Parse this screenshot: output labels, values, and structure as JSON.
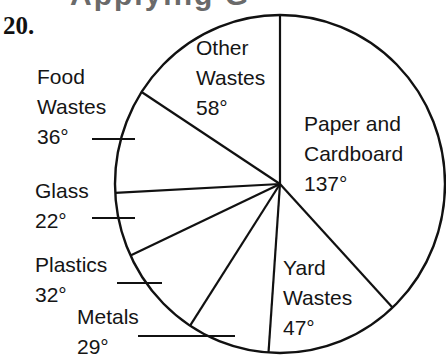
{
  "problem_number": "20.",
  "top_cut_text": "Applying G",
  "chart_data": {
    "type": "pie",
    "title": "",
    "unit": "degrees",
    "start_angle_deg": 0,
    "direction": "clockwise",
    "categories": [
      "Paper and Cardboard",
      "Yard Wastes",
      "Metals",
      "Plastics",
      "Glass",
      "Food Wastes",
      "Other Wastes"
    ],
    "values": [
      137,
      47,
      29,
      32,
      22,
      36,
      58
    ],
    "value_labels": [
      "137°",
      "47°",
      "29°",
      "32°",
      "22°",
      "36°",
      "58°"
    ],
    "colors": [
      "#ffffff",
      "#ffffff",
      "#ffffff",
      "#ffffff",
      "#ffffff",
      "#ffffff",
      "#ffffff"
    ],
    "stroke": "#111111",
    "legend": "none (labels placed on/beside slices)"
  },
  "labels": {
    "paper": {
      "line1": "Paper and",
      "line2": "Cardboard",
      "value": "137°"
    },
    "yard": {
      "line1": "Yard",
      "line2": "Wastes",
      "value": "47°"
    },
    "metals": {
      "line1": "Metals",
      "value": "29°"
    },
    "plastics": {
      "line1": "Plastics",
      "value": "32°"
    },
    "glass": {
      "line1": "Glass",
      "value": "22°"
    },
    "food": {
      "line1": "Food",
      "line2": "Wastes",
      "value": "36°"
    },
    "other": {
      "line1": "Other",
      "line2": "Wastes",
      "value": "58°"
    }
  }
}
